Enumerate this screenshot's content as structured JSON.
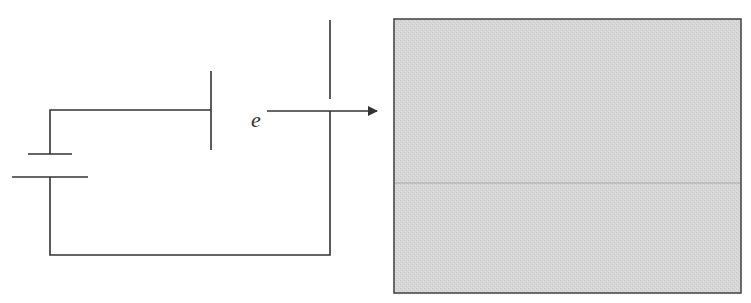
{
  "diagram": {
    "particle_label": "e",
    "colors": {
      "wire": "#333333",
      "screen_fill": "#d4d4d4",
      "screen_border": "#4a4a4a",
      "screen_midline": "#a8a8a8",
      "background": "#ffffff"
    },
    "components": [
      {
        "id": "battery",
        "type": "battery"
      },
      {
        "id": "plate-left",
        "type": "plate"
      },
      {
        "id": "plate-right",
        "type": "plate-with-aperture"
      },
      {
        "id": "electron-path",
        "type": "arrow",
        "label": "e"
      },
      {
        "id": "screen",
        "type": "fluorescent-screen"
      }
    ]
  }
}
